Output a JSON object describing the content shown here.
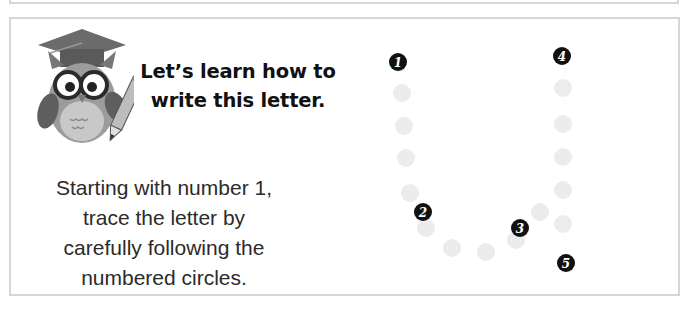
{
  "lesson": {
    "heading_line1": "Let’s learn how to",
    "heading_line2": "write this letter.",
    "instructions": [
      "Starting with number 1,",
      "trace the letter by",
      "carefully following the",
      "numbered circles."
    ],
    "mascot": "owl-with-graduation-cap-and-pencil"
  },
  "tracing": {
    "letter": "U",
    "badges": [
      {
        "label": "1",
        "x": 398,
        "y": 62
      },
      {
        "label": "2",
        "x": 423,
        "y": 212
      },
      {
        "label": "3",
        "x": 520,
        "y": 228
      },
      {
        "label": "4",
        "x": 562,
        "y": 56
      },
      {
        "label": "5",
        "x": 566,
        "y": 263
      }
    ],
    "guide_dots": [
      {
        "x": 402,
        "y": 93
      },
      {
        "x": 404,
        "y": 126
      },
      {
        "x": 406,
        "y": 158
      },
      {
        "x": 410,
        "y": 193
      },
      {
        "x": 426,
        "y": 228
      },
      {
        "x": 452,
        "y": 248
      },
      {
        "x": 486,
        "y": 252
      },
      {
        "x": 516,
        "y": 240
      },
      {
        "x": 540,
        "y": 212
      },
      {
        "x": 563,
        "y": 88
      },
      {
        "x": 563,
        "y": 124
      },
      {
        "x": 563,
        "y": 157
      },
      {
        "x": 563,
        "y": 190
      },
      {
        "x": 563,
        "y": 224
      }
    ]
  },
  "colors": {
    "border": "#d6d6d6",
    "badge": "#111111",
    "guide_dot": "#ececec",
    "text": "#2b2b2b"
  }
}
